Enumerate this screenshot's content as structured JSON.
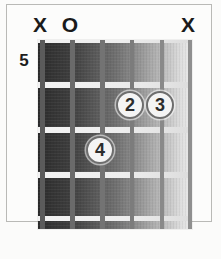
{
  "diagram": {
    "kind": "guitar-chord-diagram",
    "starting_fret_label": "5",
    "string_count": 6,
    "fret_count": 4,
    "geometry": {
      "board_left": 38,
      "board_top": 40,
      "board_width": 154,
      "board_height": 189,
      "string_x": [
        2,
        32,
        62,
        92,
        122,
        150
      ],
      "fret_y": [
        0,
        42,
        87,
        132,
        176
      ],
      "fret_thickness": [
        5,
        5,
        5,
        5,
        5
      ]
    },
    "colors": {
      "board_dark": "#2a2a2a",
      "board_light": "#eaeaea",
      "fret_wire": "#f2f2f2",
      "string": "#737373",
      "dot_fill": "#f4f4f4",
      "dot_stroke": "#6e6e6e",
      "text": "#1a1a1a",
      "frame": "#b9b9b6",
      "page_background": "#fbfbfa"
    }
  },
  "markers": [
    {
      "id": "marker-string-1",
      "symbol": "X",
      "meaning": "muted",
      "string": 1,
      "x": 40,
      "y": 14
    },
    {
      "id": "marker-string-2",
      "symbol": "O",
      "meaning": "open",
      "string": 2,
      "x": 70,
      "y": 14
    },
    {
      "id": "marker-string-6",
      "symbol": "X",
      "meaning": "muted",
      "string": 6,
      "x": 188,
      "y": 14
    }
  ],
  "fingerings": [
    {
      "id": "finger-dot-2",
      "finger": "2",
      "string": 4,
      "fret": 6,
      "x": 130,
      "y": 105
    },
    {
      "id": "finger-dot-3",
      "finger": "3",
      "string": 5,
      "fret": 6,
      "x": 160,
      "y": 105
    },
    {
      "id": "finger-dot-4",
      "finger": "4",
      "string": 3,
      "fret": 7,
      "x": 100,
      "y": 150
    }
  ],
  "strings": [
    {
      "id": "string-1",
      "index": 1,
      "x": 2,
      "width": 5
    },
    {
      "id": "string-2",
      "index": 2,
      "x": 32,
      "width": 5
    },
    {
      "id": "string-3",
      "index": 3,
      "x": 62,
      "width": 5
    },
    {
      "id": "string-4",
      "index": 4,
      "x": 92,
      "width": 4
    },
    {
      "id": "string-5",
      "index": 5,
      "x": 122,
      "width": 4
    },
    {
      "id": "string-6",
      "index": 6,
      "x": 150,
      "width": 4
    }
  ],
  "frets": [
    {
      "id": "fret-line-nut",
      "index": 0,
      "y": 0,
      "height": 3
    },
    {
      "id": "fret-line-1",
      "index": 1,
      "y": 42,
      "height": 6
    },
    {
      "id": "fret-line-2",
      "index": 2,
      "y": 87,
      "height": 6
    },
    {
      "id": "fret-line-3",
      "index": 3,
      "y": 132,
      "height": 6
    },
    {
      "id": "fret-line-4",
      "index": 4,
      "y": 176,
      "height": 5
    }
  ]
}
